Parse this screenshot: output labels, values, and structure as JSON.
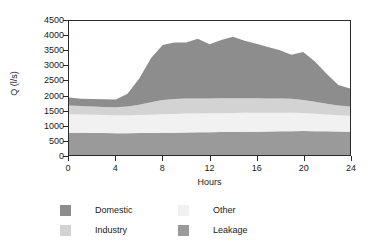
{
  "chart_data": {
    "type": "area",
    "stacked": true,
    "title": "",
    "xlabel": "Hours",
    "ylabel": "Q (l/s)",
    "xlim": [
      0,
      24
    ],
    "ylim": [
      0,
      4500
    ],
    "xticks": [
      0,
      4,
      8,
      12,
      16,
      20,
      24
    ],
    "yticks": [
      0,
      500,
      1000,
      1500,
      2000,
      2500,
      3000,
      3500,
      4000,
      4500
    ],
    "grid": false,
    "legend_position": "bottom",
    "x": [
      0,
      1,
      2,
      3,
      4,
      5,
      6,
      7,
      8,
      9,
      10,
      11,
      12,
      13,
      14,
      15,
      16,
      17,
      18,
      19,
      20,
      21,
      22,
      23,
      24
    ],
    "series": [
      {
        "name": "Leakage",
        "color": "#9a9a9a",
        "stack_order": 1,
        "values": [
          750,
          745,
          740,
          735,
          730,
          730,
          735,
          740,
          745,
          750,
          755,
          760,
          765,
          770,
          775,
          780,
          785,
          790,
          795,
          800,
          805,
          800,
          795,
          790,
          785
        ]
      },
      {
        "name": "Other",
        "color": "#f1f1f1",
        "stack_order": 2,
        "values": [
          620,
          615,
          610,
          605,
          600,
          600,
          605,
          615,
          625,
          630,
          635,
          635,
          635,
          635,
          635,
          635,
          630,
          625,
          620,
          615,
          605,
          585,
          565,
          545,
          530
        ]
      },
      {
        "name": "Industry",
        "color": "#d3d3d3",
        "stack_order": 3,
        "values": [
          290,
          285,
          280,
          275,
          270,
          300,
          350,
          420,
          480,
          500,
          505,
          505,
          500,
          500,
          500,
          495,
          490,
          485,
          480,
          470,
          440,
          400,
          360,
          330,
          310
        ]
      },
      {
        "name": "Domestic",
        "color": "#8d8d8d",
        "stack_order": 4,
        "values": [
          270,
          245,
          250,
          255,
          265,
          430,
          880,
          1470,
          1840,
          1900,
          1885,
          2000,
          1820,
          1960,
          2060,
          1930,
          1830,
          1730,
          1625,
          1480,
          1610,
          1355,
          1010,
          690,
          605
        ]
      }
    ],
    "stacked_totals": [
      1930,
      1890,
      1880,
      1870,
      1865,
      2060,
      2570,
      3245,
      3690,
      3780,
      3780,
      3900,
      3720,
      3865,
      3970,
      3840,
      3735,
      3630,
      3520,
      3365,
      3460,
      3140,
      2730,
      2355,
      2230
    ],
    "annotations": []
  },
  "axes": {
    "y_title": "Q (l/s)",
    "x_title": "Hours",
    "y_tick_labels": [
      "4500",
      "4000",
      "3500",
      "3000",
      "2500",
      "2000",
      "1500",
      "1000",
      "500",
      "0"
    ],
    "x_tick_labels": [
      "0",
      "4",
      "8",
      "12",
      "16",
      "20",
      "24"
    ]
  },
  "legend": {
    "items": [
      {
        "label": "Domestic",
        "color": "#8d8d8d"
      },
      {
        "label": "Other",
        "color": "#f1f1f1"
      },
      {
        "label": "Industry",
        "color": "#d3d3d3"
      },
      {
        "label": "Leakage",
        "color": "#9a9a9a"
      }
    ]
  }
}
